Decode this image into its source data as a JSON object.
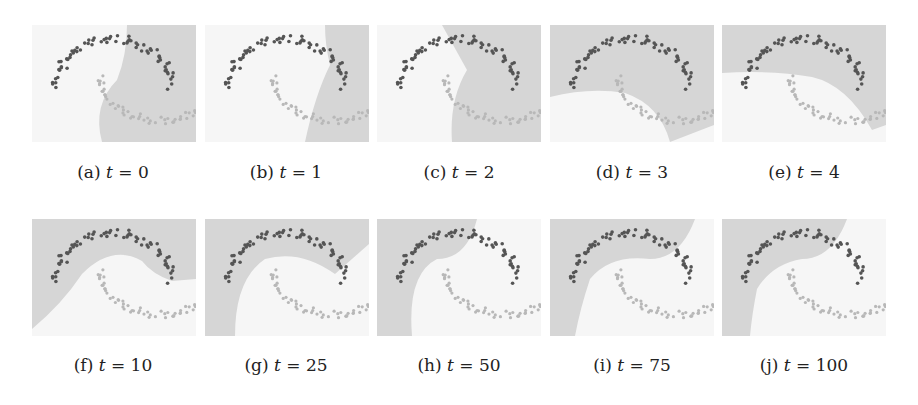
{
  "figure": {
    "panels": [
      {
        "label": "(a)",
        "var": "t",
        "eq": " = ",
        "value": "0"
      },
      {
        "label": "(b)",
        "var": "t",
        "eq": " = ",
        "value": "1"
      },
      {
        "label": "(c)",
        "var": "t",
        "eq": " = ",
        "value": "2"
      },
      {
        "label": "(d)",
        "var": "t",
        "eq": " = ",
        "value": "3"
      },
      {
        "label": "(e)",
        "var": "t",
        "eq": " = ",
        "value": "4"
      },
      {
        "label": "(f)",
        "var": "t",
        "eq": " = ",
        "value": "10"
      },
      {
        "label": "(g)",
        "var": "t",
        "eq": " = ",
        "value": "25"
      },
      {
        "label": "(h)",
        "var": "t",
        "eq": " = ",
        "value": "50"
      },
      {
        "label": "(i)",
        "var": "t",
        "eq": " = ",
        "value": "75"
      },
      {
        "label": "(j)",
        "var": "t",
        "eq": " = ",
        "value": "100"
      }
    ],
    "colors": {
      "region_shaded": "#d6d6d6",
      "region_light": "#f6f6f6",
      "class_dark": "#555555",
      "class_light": "#b8b8b8"
    }
  }
}
